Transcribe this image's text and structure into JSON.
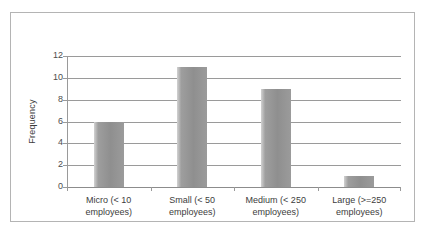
{
  "chart_data": {
    "type": "bar",
    "title": "",
    "xlabel": "",
    "ylabel": "Frequency",
    "categories": [
      "Micro (< 10\nemployees)",
      "Small (< 50\nemployees)",
      "Medium (< 250\nemployees)",
      "Large (>=250\nemployees)"
    ],
    "values": [
      6,
      11,
      9,
      1
    ],
    "ylim": [
      0,
      12
    ],
    "ytick_labels": [
      "12",
      "10",
      "8",
      "6",
      "4",
      "2",
      "0"
    ],
    "ytick_values": [
      12,
      10,
      8,
      6,
      4,
      2,
      0
    ],
    "grid": true,
    "legend": false,
    "colors": {
      "bar": "#9a9a9a",
      "bar_highlight": "#d2d2d2",
      "gridline": "#9a9a9a",
      "axis_text": "#3d3d3d",
      "border": "#b4b4b4",
      "background": "#ffffff"
    }
  }
}
